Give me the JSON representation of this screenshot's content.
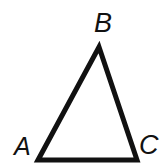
{
  "figure": {
    "kind": "geometry-diagram",
    "shape": "triangle",
    "background_color": "#ffffff",
    "stroke_color": "#111111",
    "stroke_width_px": 5,
    "canvas": {
      "width": 164,
      "height": 167
    },
    "vertices": [
      {
        "id": "A",
        "label": "A",
        "x": 38,
        "y": 160,
        "position": "bottom-left"
      },
      {
        "id": "B",
        "label": "B",
        "x": 99,
        "y": 47,
        "position": "apex-top"
      },
      {
        "id": "C",
        "label": "C",
        "x": 137,
        "y": 160,
        "position": "bottom-right"
      }
    ],
    "edges": [
      {
        "id": "AB",
        "from": "A",
        "to": "B"
      },
      {
        "id": "BC",
        "from": "B",
        "to": "C"
      },
      {
        "id": "CA",
        "from": "C",
        "to": "A"
      }
    ],
    "labels": {
      "A": "A",
      "B": "B",
      "C": "C"
    },
    "polygon_points": "38,160 99,47 137,160"
  }
}
